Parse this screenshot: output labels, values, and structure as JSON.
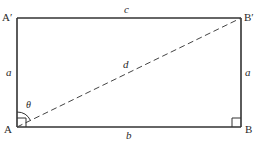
{
  "diagram": {
    "vertices": {
      "top_left": "A′",
      "top_right": "B′",
      "bottom_left": "A",
      "bottom_right": "B"
    },
    "sides": {
      "top": "c",
      "bottom": "b",
      "left": "a",
      "right": "a"
    },
    "diagonal": "d",
    "angle": "θ",
    "colors": {
      "stroke": "#333333",
      "text": "#2a2a2a",
      "background": "#ffffff"
    }
  }
}
